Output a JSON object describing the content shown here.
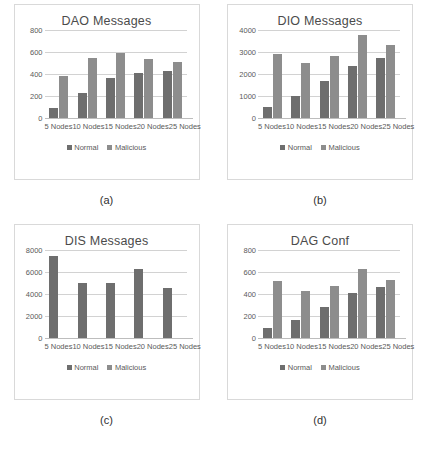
{
  "figure": {
    "panels": [
      {
        "caption": "(a)",
        "chart_data": {
          "type": "bar",
          "title": "DAO Messages",
          "xlabel": "",
          "ylabel": "",
          "categories": [
            "5 Nodes",
            "10 Nodes",
            "15 Nodes",
            "20 Nodes",
            "25 Nodes"
          ],
          "series": [
            {
              "name": "Normal",
              "values": [
                95,
                230,
                360,
                405,
                430
              ],
              "color": "#6e6e6e"
            },
            {
              "name": "Malicious",
              "values": [
                380,
                550,
                590,
                540,
                510
              ],
              "color": "#8d8d8d"
            }
          ],
          "yticks": [
            0,
            200,
            400,
            600,
            800
          ],
          "ylim": [
            0,
            800
          ],
          "grid": true,
          "legend": [
            "Normal",
            "Malicious"
          ],
          "legend_position": "bottom"
        }
      },
      {
        "caption": "(b)",
        "chart_data": {
          "type": "bar",
          "title": "DIO Messages",
          "xlabel": "",
          "ylabel": "",
          "categories": [
            "5 Nodes",
            "10 Nodes",
            "15 Nodes",
            "20 Nodes",
            "25 Nodes"
          ],
          "series": [
            {
              "name": "Normal",
              "values": [
                520,
                1000,
                1680,
                2350,
                2720
              ],
              "color": "#6e6e6e"
            },
            {
              "name": "Malicious",
              "values": [
                2930,
                2500,
                2820,
                3790,
                3330
              ],
              "color": "#8d8d8d"
            }
          ],
          "yticks": [
            0,
            1000,
            2000,
            3000,
            4000
          ],
          "ylim": [
            0,
            4000
          ],
          "grid": true,
          "legend": [
            "Normal",
            "Malicious"
          ],
          "legend_position": "bottom"
        }
      },
      {
        "caption": "(c)",
        "chart_data": {
          "type": "bar",
          "title": "DIS Messages",
          "xlabel": "",
          "ylabel": "",
          "categories": [
            "5 Nodes",
            "10 Nodes",
            "15 Nodes",
            "20 Nodes",
            "25 Nodes"
          ],
          "series": [
            {
              "name": "Normal",
              "values": [
                7450,
                4980,
                5010,
                6300,
                4540
              ],
              "color": "#6e6e6e"
            },
            {
              "name": "Malicious",
              "values": [
                0,
                0,
                0,
                0,
                0
              ],
              "color": "#8d8d8d"
            }
          ],
          "yticks": [
            0,
            2000,
            4000,
            6000,
            8000
          ],
          "ylim": [
            0,
            8000
          ],
          "grid": true,
          "legend": [
            "Normal",
            "Malicious"
          ],
          "legend_position": "bottom"
        }
      },
      {
        "caption": "(d)",
        "chart_data": {
          "type": "bar",
          "title": "DAG Conf",
          "xlabel": "",
          "ylabel": "",
          "categories": [
            "5 Nodes",
            "10 Nodes",
            "15 Nodes",
            "20 Nodes",
            "25 Nodes"
          ],
          "series": [
            {
              "name": "Normal",
              "values": [
                95,
                165,
                285,
                410,
                465
              ],
              "color": "#6e6e6e"
            },
            {
              "name": "Malicious",
              "values": [
                520,
                425,
                470,
                625,
                530
              ],
              "color": "#8d8d8d"
            }
          ],
          "yticks": [
            0,
            200,
            400,
            600,
            800
          ],
          "ylim": [
            0,
            800
          ],
          "grid": true,
          "legend": [
            "Normal",
            "Malicious"
          ],
          "legend_position": "bottom"
        }
      }
    ],
    "clipped_footer_text": ""
  }
}
